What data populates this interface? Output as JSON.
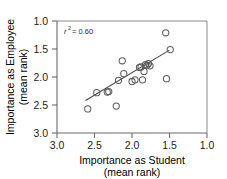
{
  "chart_data": {
    "type": "scatter",
    "title": "",
    "xlabel": "Importance as Student",
    "xlabel_line2": "(mean rank)",
    "ylabel": "Importance as Employee",
    "ylabel_line2": "(mean rank)",
    "xlim": [
      3.0,
      1.0
    ],
    "ylim": [
      3.0,
      1.0
    ],
    "x_axis_reversed": true,
    "y_axis_reversed": true,
    "grid": false,
    "legend": "none",
    "xticks": [
      "3.0",
      "2.5",
      "2.0",
      "1.5",
      "1.0"
    ],
    "xtick_values": [
      3.0,
      2.5,
      2.0,
      1.5,
      1.0
    ],
    "yticks": [
      "1.0",
      "1.5",
      "2.0",
      "2.5",
      "3.0"
    ],
    "ytick_values": [
      1.0,
      1.5,
      2.0,
      2.5,
      3.0
    ],
    "annotation": "r2 = 0.60",
    "annotation_symbol": "r",
    "annotation_superscript": "2",
    "annotation_value": "= 0.60",
    "r_squared": 0.6,
    "marker": "open-circle",
    "marker_color": "#5d5d5d",
    "point_count": 21,
    "points": [
      {
        "x": 2.59,
        "y": 2.57
      },
      {
        "x": 2.47,
        "y": 2.28
      },
      {
        "x": 2.33,
        "y": 2.27
      },
      {
        "x": 2.31,
        "y": 2.26
      },
      {
        "x": 2.21,
        "y": 2.52
      },
      {
        "x": 2.18,
        "y": 2.06
      },
      {
        "x": 2.13,
        "y": 1.71
      },
      {
        "x": 2.11,
        "y": 1.94
      },
      {
        "x": 2.0,
        "y": 2.08
      },
      {
        "x": 1.96,
        "y": 2.05
      },
      {
        "x": 1.9,
        "y": 1.83
      },
      {
        "x": 1.88,
        "y": 1.82
      },
      {
        "x": 1.86,
        "y": 2.05
      },
      {
        "x": 1.84,
        "y": 1.9
      },
      {
        "x": 1.82,
        "y": 1.78
      },
      {
        "x": 1.8,
        "y": 1.79
      },
      {
        "x": 1.78,
        "y": 1.76
      },
      {
        "x": 1.76,
        "y": 1.8
      },
      {
        "x": 1.55,
        "y": 1.21
      },
      {
        "x": 1.54,
        "y": 2.03
      },
      {
        "x": 1.49,
        "y": 1.51
      }
    ],
    "fit_line": {
      "type": "linear-regression",
      "x_start": 2.62,
      "y_start": 2.42,
      "x_end": 1.5,
      "y_end": 1.52
    }
  }
}
